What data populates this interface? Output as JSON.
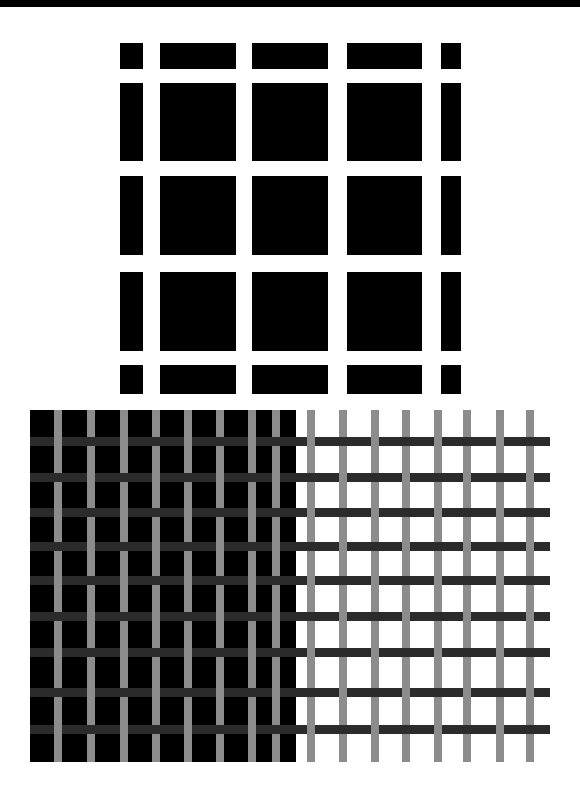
{
  "colors": {
    "background": "#ffffff",
    "top_bar": "#000000",
    "grid_block": "#000000",
    "grating_dark_field": "#000000",
    "vertical_bar": "#8c8c8c",
    "horizontal_bar": "#2b2b2b"
  },
  "hermann_grid": {
    "columns": [
      [
        120,
        143
      ],
      [
        160,
        236
      ],
      [
        252,
        328
      ],
      [
        347,
        422
      ],
      [
        441,
        461
      ]
    ],
    "rows": [
      [
        43,
        69
      ],
      [
        83,
        161
      ],
      [
        176,
        255
      ],
      [
        272,
        351
      ],
      [
        365,
        394
      ]
    ]
  },
  "grating": {
    "dark_field": {
      "x0": 30,
      "x1": 296,
      "y0": 410,
      "y1": 762
    },
    "vertical_bar_width": 8,
    "vertical_bar_top": 410,
    "vertical_bar_bottom": 762,
    "vertical_bars_x": [
      54,
      87,
      120,
      152,
      184,
      216,
      248,
      272,
      307,
      339,
      371,
      402,
      434,
      463,
      496,
      526
    ],
    "horizontal_bar_height": 9,
    "horizontal_bar_x0": 30,
    "horizontal_bar_x1": 550,
    "horizontal_bars_y": [
      437,
      473,
      508,
      542,
      576,
      612,
      648,
      688,
      725
    ]
  }
}
